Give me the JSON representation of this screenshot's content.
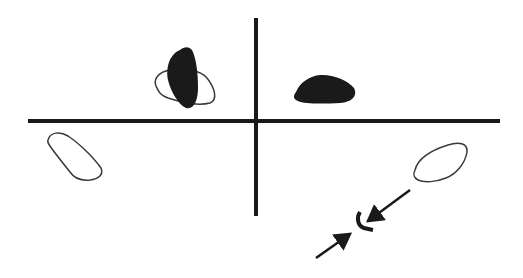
{
  "diagram": {
    "colors": {
      "background": "#ffffff",
      "ink": "#1a1a1a",
      "outline": "#3a3a3a"
    },
    "axes": {
      "horizontal": {
        "x1": 28,
        "y1": 121,
        "x2": 500,
        "y2": 121,
        "stroke_width": 4
      },
      "vertical": {
        "x1": 256,
        "y1": 18,
        "x2": 256,
        "y2": 216,
        "stroke_width": 4
      }
    },
    "shapes": [
      {
        "id": "outline-blob-upper-left",
        "fill": "none",
        "quadrant": "upper-left"
      },
      {
        "id": "filled-blob-upper-left",
        "fill": "ink",
        "quadrant": "upper-left"
      },
      {
        "id": "filled-blob-upper-right",
        "fill": "ink",
        "quadrant": "upper-right"
      },
      {
        "id": "outline-blob-lower-left",
        "fill": "none",
        "quadrant": "lower-left"
      },
      {
        "id": "outline-blob-lower-right",
        "fill": "none",
        "quadrant": "lower-right"
      }
    ],
    "arrows": [
      {
        "id": "arrow-from-upper-right",
        "from": [
          410,
          190
        ],
        "to": [
          366,
          222
        ]
      },
      {
        "id": "arrow-from-lower-left",
        "from": [
          316,
          258
        ],
        "to": [
          353,
          232
        ]
      }
    ],
    "bracket": {
      "id": "curved-bracket",
      "position": [
        356,
        220
      ]
    }
  }
}
